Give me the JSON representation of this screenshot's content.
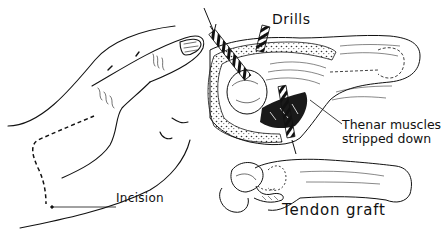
{
  "figure": {
    "type": "medical-line-illustration",
    "panels": [
      {
        "name": "hand-outline",
        "description": "Outline of hand with dashed incision line along thenar region"
      },
      {
        "name": "surgical-field",
        "description": "Open operative field with drills inserted and thenar muscles retracted"
      },
      {
        "name": "bone-detail",
        "description": "Metacarpal bone with tendon graft looped at base"
      }
    ]
  },
  "labels": {
    "drills": "Drills",
    "thenar_line1": "Thenar muscles",
    "thenar_line2": "stripped down",
    "incision": "Incision",
    "tendon_graft": "Tendon graft"
  },
  "colors": {
    "ink": "#111111",
    "background": "#ffffff"
  }
}
